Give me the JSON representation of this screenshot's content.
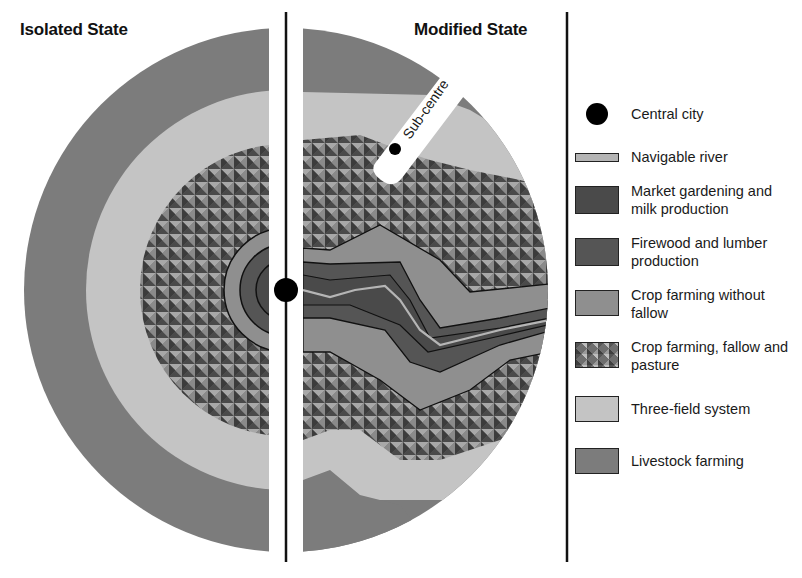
{
  "titles": {
    "left": "Isolated State",
    "right": "Modified State"
  },
  "map_labels": {
    "sub_centre": "Sub-centre"
  },
  "colors": {
    "livestock_farming": "#7c7c7c",
    "three_field_system": "#c4c4c4",
    "crop_farming_fallow_pasture_base": "#6e6e6e",
    "crop_farming_without_fallow": "#8f8f8f",
    "firewood_and_lumber": "#555555",
    "market_gardening": "#4a4a4a",
    "navigable_river": "#b5b5b5",
    "central_city": "#000000",
    "divider": "#111111"
  },
  "legend": {
    "items": [
      {
        "id": "central-city",
        "label": "Central city",
        "icon": "black-dot"
      },
      {
        "id": "navigable-river",
        "label": "Navigable river",
        "icon": "thin-bar"
      },
      {
        "id": "market-gardening",
        "label": "Market gardening and milk production",
        "icon": "swatch"
      },
      {
        "id": "firewood-lumber",
        "label": "Firewood and lumber production",
        "icon": "swatch"
      },
      {
        "id": "crop-without-fallow",
        "label": "Crop farming without fallow",
        "icon": "swatch"
      },
      {
        "id": "crop-fallow-pasture",
        "label": "Crop farming, fallow and pasture",
        "icon": "pattern-swatch"
      },
      {
        "id": "three-field",
        "label": "Three-field system",
        "icon": "swatch"
      },
      {
        "id": "livestock",
        "label": "Livestock farming",
        "icon": "swatch"
      }
    ]
  }
}
